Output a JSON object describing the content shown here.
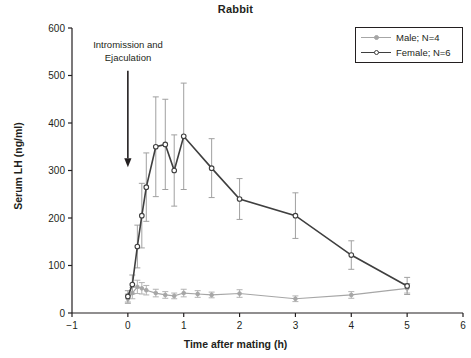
{
  "chart_data": {
    "type": "line",
    "title": "Rabbit",
    "xlabel": "Time after mating (h)",
    "ylabel": "Serum LH (ng/ml)",
    "xlim": [
      -1,
      6
    ],
    "ylim": [
      0,
      600
    ],
    "xticks": [
      -1,
      0,
      1,
      2,
      3,
      4,
      5,
      6
    ],
    "xticklabels": [
      "−1",
      "0",
      "1",
      "2",
      "3",
      "4",
      "5",
      "6"
    ],
    "yticks": [
      0,
      100,
      200,
      300,
      400,
      500,
      600
    ],
    "yticklabels": [
      "0",
      "100",
      "200",
      "300",
      "400",
      "500",
      "600"
    ],
    "grid": false,
    "legend_position": "upper right",
    "annotations": [
      {
        "text_line1": "Intromission and",
        "text_line2": "Ejaculation",
        "arrow_x": 0.0,
        "arrow_y_top": 510,
        "arrow_y_bottom": 330
      }
    ],
    "series": [
      {
        "name": "Male; N=4",
        "color": "#a6a6a6",
        "marker": "filled-circle",
        "x": [
          0.0,
          0.08,
          0.17,
          0.25,
          0.33,
          0.5,
          0.67,
          0.83,
          1.0,
          1.25,
          1.5,
          2.0,
          3.0,
          4.0,
          5.0
        ],
        "y": [
          30,
          42,
          55,
          52,
          48,
          42,
          38,
          36,
          42,
          40,
          38,
          41,
          30,
          38,
          52
        ],
        "yerr": [
          10,
          12,
          14,
          12,
          10,
          8,
          7,
          6,
          8,
          7,
          6,
          8,
          6,
          7,
          10
        ]
      },
      {
        "name": "Female; N=6",
        "color": "#3f3f3f",
        "marker": "open-circle",
        "x": [
          0.0,
          0.08,
          0.17,
          0.25,
          0.33,
          0.5,
          0.67,
          0.83,
          1.0,
          1.5,
          2.0,
          3.0,
          4.0,
          5.0
        ],
        "y": [
          35,
          60,
          140,
          205,
          265,
          350,
          355,
          300,
          372,
          305,
          240,
          205,
          122,
          57
        ],
        "yerr": [
          12,
          20,
          45,
          68,
          72,
          105,
          95,
          75,
          112,
          62,
          43,
          48,
          30,
          18
        ]
      }
    ]
  },
  "legend": {
    "entries": [
      {
        "label": "Male; N=4"
      },
      {
        "label": "Female; N=6"
      }
    ]
  }
}
